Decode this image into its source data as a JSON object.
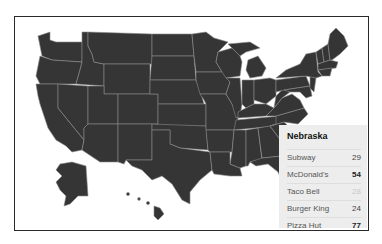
{
  "map": {
    "type": "choropleth-us-states",
    "fill_color": "#353535",
    "border_color": "#8a8a8a",
    "background": "#ffffff"
  },
  "tooltip": {
    "state": "Nebraska",
    "rows": [
      {
        "label": "Subway",
        "value": "29",
        "style": "normal"
      },
      {
        "label": "McDonald's",
        "value": "54",
        "style": "bold"
      },
      {
        "label": "Taco Bell",
        "value": "28",
        "style": "faint"
      },
      {
        "label": "Burger King",
        "value": "24",
        "style": "normal"
      },
      {
        "label": "Pizza Hut",
        "value": "77",
        "style": "bold"
      }
    ]
  }
}
